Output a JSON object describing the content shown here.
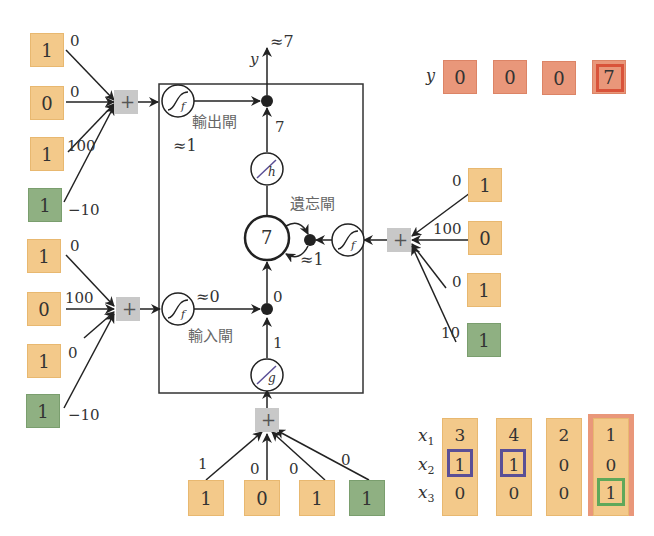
{
  "diagram": {
    "colors": {
      "input_orange": "#f3c98a",
      "bias_green": "#8fb082",
      "output_red": "#e9977a",
      "sum_gray": "#c8c8c8",
      "highlight_blue": "#5a4f96",
      "highlight_green": "#5fa85a",
      "highlight_red": "#d9533a"
    },
    "output_gate": {
      "label": "輸出閘",
      "approx_value": "≈1",
      "inputs": [
        "1",
        "0",
        "1",
        "1"
      ],
      "weights": [
        "0",
        "0",
        "100",
        "−10"
      ]
    },
    "input_gate": {
      "label": "輸入閘",
      "approx_value": "≈0",
      "inputs": [
        "1",
        "0",
        "1",
        "1"
      ],
      "weights": [
        "0",
        "100",
        "0",
        "−10"
      ]
    },
    "forget_gate": {
      "label": "遺忘閘",
      "approx_value": "≈1",
      "inputs": [
        "1",
        "0",
        "1",
        "1"
      ],
      "weights": [
        "0",
        "100",
        "0",
        "10"
      ]
    },
    "cell_input": {
      "inputs": [
        "1",
        "0",
        "1",
        "1"
      ],
      "weights": [
        "1",
        "0",
        "0",
        "0"
      ]
    },
    "cell": {
      "memory_value": "7",
      "g_output": "1",
      "after_input_gate": "0",
      "h_output": "7",
      "g_label": "g",
      "h_label": "h",
      "f_label": "f",
      "sum_symbol": "+"
    },
    "output": {
      "label": "y",
      "approx_value": "≈7"
    },
    "y_sequence": {
      "label": "y",
      "values": [
        "0",
        "0",
        "0",
        "7"
      ],
      "highlighted_index": 3
    },
    "x_sequence": {
      "row_labels": [
        "x",
        "x",
        "x"
      ],
      "row_subscripts": [
        "1",
        "2",
        "3"
      ],
      "columns": [
        [
          "3",
          "1",
          "0"
        ],
        [
          "4",
          "1",
          "0"
        ],
        [
          "2",
          "0",
          "0"
        ],
        [
          "1",
          "0",
          "1"
        ]
      ]
    }
  }
}
